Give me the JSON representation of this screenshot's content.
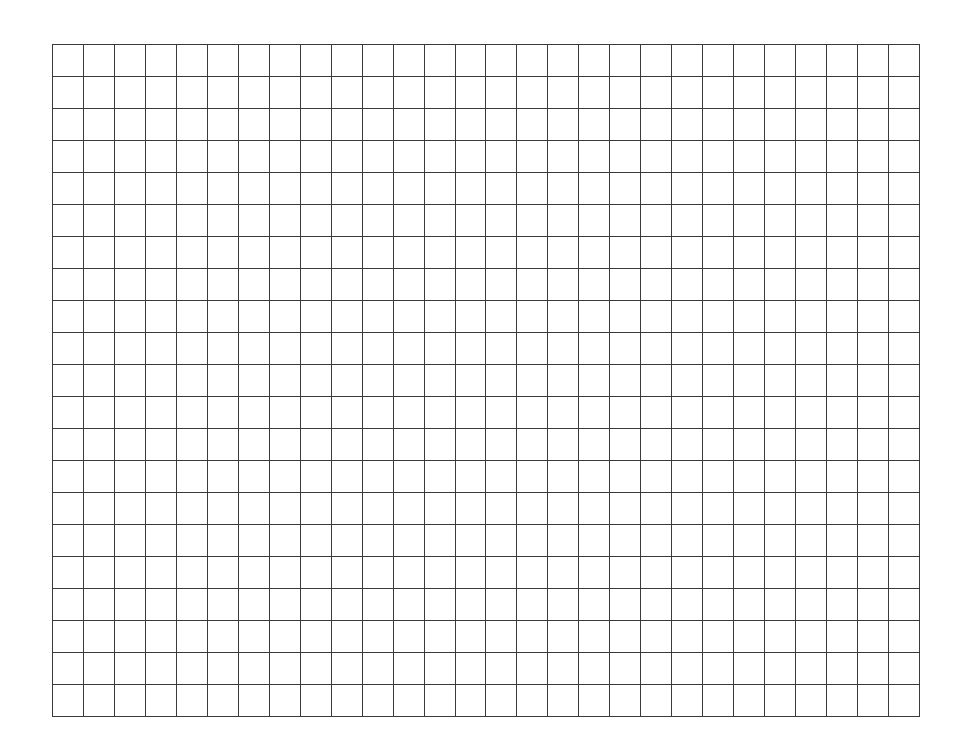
{
  "grid": {
    "columns": 28,
    "rows": 21,
    "line_color": "#3a3a3a",
    "background_color": "#ffffff"
  }
}
